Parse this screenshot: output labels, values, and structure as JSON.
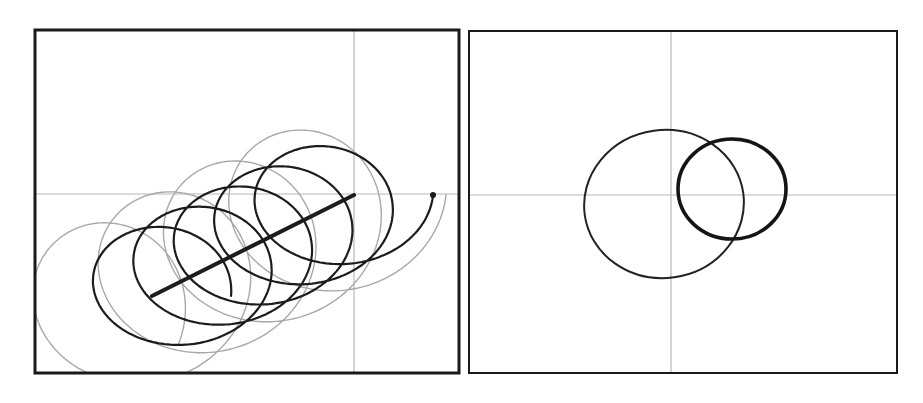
{
  "figure": {
    "width": 923,
    "height": 403,
    "background": "#ffffff",
    "frame_color": "#1a1a1a",
    "axis_color": "#b8b8b8",
    "ink_color": "#1c1c1c",
    "ghost_color": "#9a9a9a"
  },
  "panels": [
    {
      "id": "left",
      "frame": {
        "x": 35,
        "y": 30,
        "w": 424,
        "h": 343,
        "stroke": 3
      },
      "axes": {
        "x0": 354,
        "y0": 194
      },
      "line": {
        "x1": 152,
        "y1": 296,
        "x2": 354,
        "y2": 195,
        "stroke": 4
      },
      "end_dot": {
        "cx": 433,
        "cy": 195,
        "r": 3
      },
      "curves": [
        {
          "name": "ghost-trochoid",
          "color": "#a8a8a8",
          "stroke": 1.4,
          "start": [
            90,
            320
          ],
          "end": [
            354,
            195
          ],
          "rx": 92,
          "ry": 88,
          "turns": 4.6,
          "phase": 3.5,
          "samples": 900
        },
        {
          "name": "ink-trochoid",
          "color": "#1c1c1c",
          "stroke": 2.2,
          "start": [
            152,
            296
          ],
          "end": [
            354,
            195
          ],
          "rx": 79,
          "ry": 64,
          "turns": 5,
          "phase": 0,
          "samples": 900
        }
      ]
    },
    {
      "id": "right",
      "frame": {
        "x": 469,
        "y": 31,
        "w": 428,
        "h": 342,
        "stroke": 2
      },
      "axes": {
        "x0": 671,
        "y0": 195
      },
      "ellipses": [
        {
          "name": "large-ellipse",
          "cx": 664,
          "cy": 204,
          "rx": 80,
          "ry": 74,
          "rotate": -8,
          "stroke": 2,
          "color": "#222222"
        },
        {
          "name": "small-thick-circle",
          "cx": 732,
          "cy": 189,
          "rx": 54,
          "ry": 50,
          "rotate": 0,
          "stroke": 3.6,
          "color": "#151515"
        }
      ]
    }
  ]
}
